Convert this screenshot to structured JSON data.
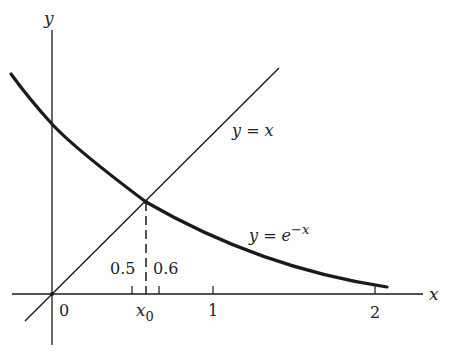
{
  "figure": {
    "axes": {
      "x_label": "x",
      "y_label": "y",
      "origin_label": "0"
    },
    "ticks": [
      {
        "value": 0.5,
        "label": "0.5"
      },
      {
        "value": 0.6,
        "label": "0.6"
      },
      {
        "value": 1,
        "label": "1"
      },
      {
        "value": 2,
        "label": "2"
      }
    ],
    "intersection": {
      "label": "x",
      "subscript": "0",
      "value": 0.567
    },
    "curves": [
      {
        "name": "line",
        "label": "y = x"
      },
      {
        "name": "exponential",
        "label_base": "y = e",
        "label_exp": "−x"
      }
    ],
    "colors": {
      "ink": "#1a1a1a",
      "background": "#ffffff"
    }
  }
}
